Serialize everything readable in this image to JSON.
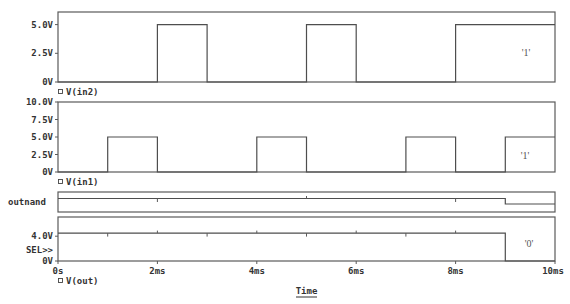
{
  "chart_data": {
    "type": "line",
    "title": "",
    "xlabel": "Time",
    "ylabel": "",
    "x_unit": "ms",
    "xlim": [
      0,
      10
    ],
    "grid": false,
    "legend_position": "below each panel",
    "x_ticks": [
      {
        "v": 0,
        "label": "0s"
      },
      {
        "v": 2,
        "label": "2ms"
      },
      {
        "v": 4,
        "label": "4ms"
      },
      {
        "v": 6,
        "label": "6ms"
      },
      {
        "v": 8,
        "label": "8ms"
      },
      {
        "v": 10,
        "label": "10ms"
      }
    ],
    "panels": [
      {
        "id": "in2",
        "kind": "analog",
        "legend": "V(in2)",
        "ylim": [
          0,
          6.1
        ],
        "y_ticks": [
          {
            "v": 5,
            "label": "5.0V"
          },
          {
            "v": 2.5,
            "label": "2.5V"
          },
          {
            "v": 0,
            "label": "0V"
          }
        ],
        "cursor_value": "'1'",
        "points": [
          [
            0,
            0
          ],
          [
            2,
            0
          ],
          [
            2,
            5
          ],
          [
            3,
            5
          ],
          [
            3,
            0
          ],
          [
            5,
            0
          ],
          [
            5,
            5
          ],
          [
            6,
            5
          ],
          [
            6,
            0
          ],
          [
            8,
            0
          ],
          [
            8,
            5
          ],
          [
            10,
            5
          ]
        ]
      },
      {
        "id": "in1",
        "kind": "analog",
        "legend": "V(in1)",
        "ylim": [
          0,
          10
        ],
        "y_ticks": [
          {
            "v": 10,
            "label": "10.0V"
          },
          {
            "v": 7.5,
            "label": "7.5V"
          },
          {
            "v": 5,
            "label": "5.0V"
          },
          {
            "v": 2.5,
            "label": "2.5V"
          },
          {
            "v": 0,
            "label": "0V"
          }
        ],
        "cursor_value": "'1'",
        "points": [
          [
            0,
            0
          ],
          [
            1,
            0
          ],
          [
            1,
            5
          ],
          [
            2,
            5
          ],
          [
            2,
            0
          ],
          [
            4,
            0
          ],
          [
            4,
            5
          ],
          [
            5,
            5
          ],
          [
            5,
            0
          ],
          [
            7,
            0
          ],
          [
            7,
            5
          ],
          [
            8,
            5
          ],
          [
            8,
            0
          ],
          [
            9,
            0
          ],
          [
            9,
            5
          ],
          [
            10,
            5
          ]
        ]
      },
      {
        "id": "outnand",
        "kind": "digital",
        "label": "outnand",
        "states": [
          [
            0,
            1
          ],
          [
            9,
            0
          ],
          [
            10,
            0
          ]
        ],
        "glitches_ms": [
          2,
          5,
          8
        ]
      },
      {
        "id": "out",
        "kind": "analog",
        "legend": "V(out)",
        "ylim": [
          0,
          7.1
        ],
        "y_ticks": [
          {
            "v": 4,
            "label": "4.0V"
          },
          {
            "v": 0,
            "label": "0V"
          }
        ],
        "selector_label": "SEL>>",
        "cursor_value": "'0'",
        "points": [
          [
            0,
            4.5
          ],
          [
            9,
            4.5
          ],
          [
            9,
            0
          ],
          [
            10,
            0
          ]
        ],
        "glitches_ms": [
          1,
          2,
          3,
          4,
          5,
          6,
          7,
          8
        ]
      }
    ]
  },
  "icons": {
    "legend_marker": "square-outline-icon"
  }
}
